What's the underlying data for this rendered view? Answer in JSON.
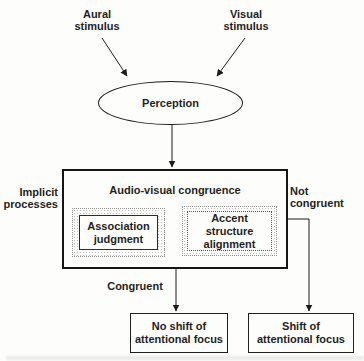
{
  "figure": {
    "inputs": {
      "aural": {
        "line1": "Aural",
        "line2": "stimulus"
      },
      "visual": {
        "line1": "Visual",
        "line2": "stimulus"
      }
    },
    "perception": {
      "label": "Perception"
    },
    "congruence": {
      "title": "Audio-visual congruence",
      "association": {
        "line1": "Association",
        "line2": "judgment"
      },
      "accent": {
        "line1": "Accent structure",
        "line2": "alignment"
      }
    },
    "side_labels": {
      "implicit": {
        "line1": "Implicit",
        "line2": "processes"
      },
      "not_congruent": {
        "line1": "Not",
        "line2": "congruent"
      },
      "congruent": "Congruent"
    },
    "outcomes": {
      "no_shift": {
        "line1": "No shift of",
        "line2": "attentional focus"
      },
      "shift": {
        "line1": "Shift of",
        "line2": "attentional focus"
      }
    },
    "colors": {
      "line": "#1b1b1b",
      "text": "#1f1f1f",
      "background": "#fdfdfb",
      "stipple": "#bdbdbd"
    }
  }
}
